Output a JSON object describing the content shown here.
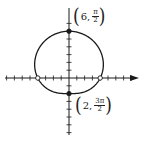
{
  "chart_data": {
    "type": "line",
    "subtype": "polar-limacon",
    "title": "",
    "xlabel": "",
    "ylabel": "",
    "equation": "r = 4 + 2 sin θ",
    "grid": false,
    "axis_ticks_unit": 1,
    "x_ticks_count_left": 8,
    "x_ticks_count_right": 8,
    "y_ticks_count_up": 7,
    "y_ticks_count_down": 7,
    "curve_points_cartesian": [
      {
        "x": 0,
        "y": 6,
        "label": "(6, π/2)",
        "marker": "filled"
      },
      {
        "x": 0,
        "y": -2,
        "label": "(2, 3π/2)",
        "marker": "filled"
      },
      {
        "x": -4,
        "y": 0,
        "marker": "open"
      },
      {
        "x": 4,
        "y": 0,
        "marker": "open"
      }
    ],
    "annotations": [
      {
        "text": "(6, π/2)",
        "r": "6",
        "theta_num": "π",
        "theta_den": "2"
      },
      {
        "text": "(2, 3π/2)",
        "r": "2",
        "theta_num": "3π",
        "theta_den": "2"
      }
    ],
    "colors": {
      "curve": "#1a1a1a",
      "axis": "#1a1a1a",
      "background": "#ffffff"
    }
  },
  "labels": {
    "top": {
      "open": "(",
      "r": "6,",
      "num": "π",
      "den": "2",
      "close": ")"
    },
    "bottom": {
      "open": "(",
      "r": "2,",
      "num": "3π",
      "den": "2",
      "close": ")"
    }
  }
}
